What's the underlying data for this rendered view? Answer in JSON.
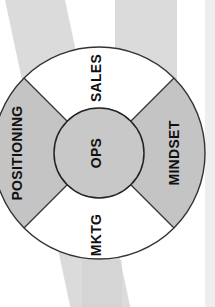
{
  "diagram": {
    "type": "segmented-ring",
    "orientation": "rotated-90-ccw",
    "center": {
      "label": "OPS",
      "fill": "#c8c8c8"
    },
    "segments": [
      {
        "position": "top",
        "label": "SALES",
        "fill": "#ffffff"
      },
      {
        "position": "right",
        "label": "MINDSET",
        "fill": "#c4c4c4"
      },
      {
        "position": "bottom",
        "label": "MKTG",
        "fill": "#ffffff"
      },
      {
        "position": "left",
        "label": "POSITIONING",
        "fill": "#c4c4c4"
      }
    ],
    "colors": {
      "outline": "#333333",
      "background": "#ffffff",
      "background_swirl": "#cfcfcf",
      "text": "#111111"
    }
  }
}
